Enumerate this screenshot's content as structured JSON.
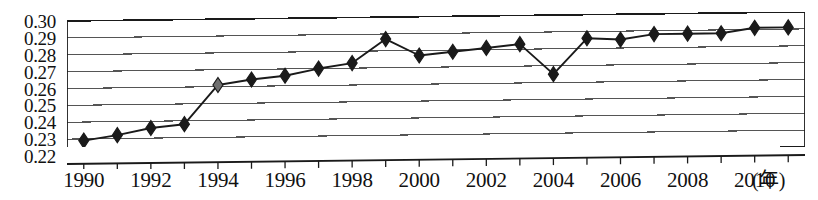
{
  "chart_data": {
    "type": "line",
    "title": "",
    "subtitle": "",
    "xlabel": "(年)",
    "ylabel": "",
    "xlim": [
      1989.5,
      2011.5
    ],
    "ylim": [
      0.22,
      0.3
    ],
    "grid": true,
    "legend": null,
    "marker": "diamond",
    "x": [
      1990,
      1991,
      1992,
      1993,
      1994,
      1995,
      1996,
      1997,
      1998,
      1999,
      2000,
      2001,
      2002,
      2003,
      2004,
      2005,
      2006,
      2007,
      2008,
      2009,
      2010,
      2011
    ],
    "categories": [
      "1990",
      "1991",
      "1992",
      "1993",
      "1994",
      "1995",
      "1996",
      "1997",
      "1998",
      "1999",
      "2000",
      "2001",
      "2002",
      "2003",
      "2004",
      "2005",
      "2006",
      "2007",
      "2008",
      "2009",
      "2010",
      "2011"
    ],
    "values": [
      0.229,
      0.232,
      0.236,
      0.238,
      0.261,
      0.264,
      0.266,
      0.27,
      0.273,
      0.287,
      0.277,
      0.279,
      0.281,
      0.283,
      0.265,
      0.286,
      0.285,
      0.288,
      0.288,
      0.288,
      0.291,
      0.291
    ],
    "series": [
      {
        "name": "",
        "values": [
          0.229,
          0.232,
          0.236,
          0.238,
          0.261,
          0.264,
          0.266,
          0.27,
          0.273,
          0.287,
          0.277,
          0.279,
          0.281,
          0.283,
          0.265,
          0.286,
          0.285,
          0.288,
          0.288,
          0.288,
          0.291,
          0.291
        ]
      }
    ],
    "y_ticks": [
      0.22,
      0.23,
      0.24,
      0.25,
      0.26,
      0.27,
      0.28,
      0.29,
      0.3
    ],
    "y_tick_labels": [
      "0.22",
      "0.23",
      "0.24",
      "0.25",
      "0.26",
      "0.27",
      "0.28",
      "0.29",
      "0.30"
    ],
    "x_ticks": [
      1990,
      1991,
      1992,
      1993,
      1994,
      1995,
      1996,
      1997,
      1998,
      1999,
      2000,
      2001,
      2002,
      2003,
      2004,
      2005,
      2006,
      2007,
      2008,
      2009,
      2010,
      2011
    ],
    "x_tick_labels": [
      "1990",
      "",
      "1992",
      "",
      "1994",
      "",
      "1996",
      "",
      "1998",
      "",
      "2000",
      "",
      "2002",
      "",
      "2004",
      "",
      "2006",
      "",
      "2008",
      "",
      "2010",
      ""
    ],
    "x_labeled_ticks": [
      {
        "value": 1990,
        "label": "1990"
      },
      {
        "value": 1992,
        "label": "1992"
      },
      {
        "value": 1994,
        "label": "1994"
      },
      {
        "value": 1996,
        "label": "1996"
      },
      {
        "value": 1998,
        "label": "1998"
      },
      {
        "value": 2000,
        "label": "2000"
      },
      {
        "value": 2002,
        "label": "2002"
      },
      {
        "value": 2004,
        "label": "2004"
      },
      {
        "value": 2006,
        "label": "2006"
      },
      {
        "value": 2008,
        "label": "2008"
      },
      {
        "value": 2010,
        "label": "2010"
      }
    ],
    "colors": {
      "line": "#1a1a1a",
      "marker": "#1a1a1a",
      "grid": "#555555",
      "axis": "#1a1a1a",
      "background": "#ffffff"
    }
  }
}
